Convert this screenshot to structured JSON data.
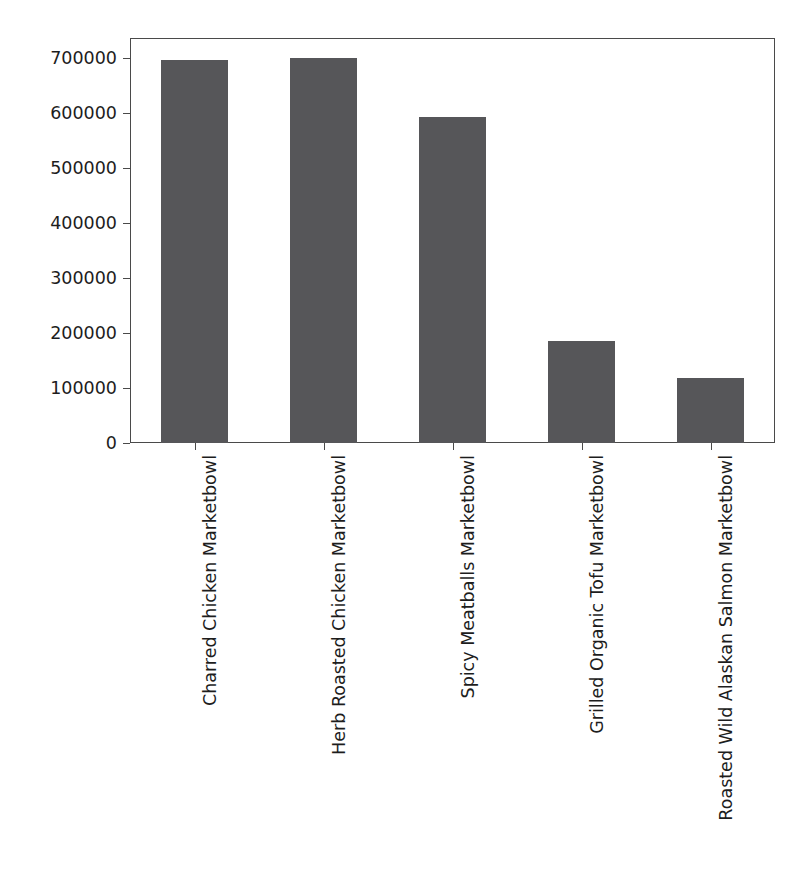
{
  "chart_data": {
    "type": "bar",
    "title": "",
    "xlabel": "",
    "ylabel": "",
    "categories": [
      "Charred Chicken Marketbowl",
      "Herb Roasted Chicken Marketbowl",
      "Spicy Meatballs Marketbowl",
      "Grilled Organic Tofu Marketbowl",
      "Roasted Wild Alaskan Salmon Marketbowl"
    ],
    "values": [
      696000,
      700000,
      593000,
      185000,
      118000
    ],
    "ylim": [
      0,
      700000
    ],
    "yticks": [
      0,
      100000,
      200000,
      300000,
      400000,
      500000,
      600000,
      700000
    ],
    "ytick_labels": [
      "0",
      "100000",
      "200000",
      "300000",
      "400000",
      "500000",
      "600000",
      "700000"
    ],
    "grid": false,
    "legend": null,
    "bar_color": "#565659",
    "axis_color": "#4a4a4a",
    "background_color": "#ffffff",
    "xtick_rotation": -90
  },
  "figure": {
    "title_text": "",
    "title_visible": false
  }
}
